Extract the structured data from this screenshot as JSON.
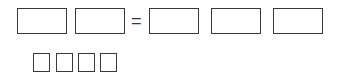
{
  "equation": {
    "operator": "=",
    "left_boxes": [
      "",
      ""
    ],
    "right_boxes": [
      "",
      "",
      ""
    ]
  },
  "answer_boxes": [
    "",
    "",
    "",
    ""
  ],
  "colors": {
    "border": "#3a3a3a",
    "background": "#ffffff"
  }
}
